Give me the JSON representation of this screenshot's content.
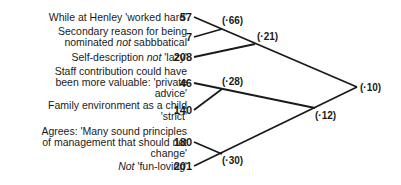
{
  "items": [
    {
      "label_lines": [
        "While at Henley 'worked hard'"
      ],
      "value": "57"
    },
    {
      "label_lines": [
        "Secondary reason for being",
        "nominated not sabbbatical"
      ],
      "value": "7"
    },
    {
      "label_lines": [
        "Self-description not 'lazy'"
      ],
      "value": "208"
    },
    {
      "label_lines": [
        "Staff contribution could have",
        "been more valuable: 'private",
        "advice'"
      ],
      "value": "46"
    },
    {
      "label_lines": [
        "Family environment as a child",
        "'strict'"
      ],
      "value": "140"
    },
    {
      "label_lines": [
        "Agrees: 'Many sound principles",
        "of management that should not",
        "change'"
      ],
      "value": "180"
    },
    {
      "label_lines": [
        "Not 'fun-loving'"
      ],
      "value": "201"
    }
  ],
  "nodes": {
    "n66": "(·66)",
    "n21": "(·21)",
    "n28": "(·28)",
    "n12": "(·12)",
    "n30": "(·30)",
    "n10": "(·10)"
  }
}
